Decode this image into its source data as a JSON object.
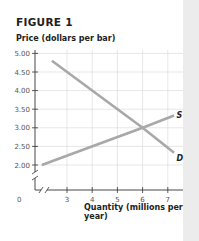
{
  "figure": {
    "title": "FIGURE 1"
  },
  "chart_data": {
    "type": "line",
    "title": "FIGURE 1",
    "ylabel": "Price (dollars per bar)",
    "xlabel": "Quantity (millions per year)",
    "y_ticks": [
      "5.00",
      "4.50",
      "4.00",
      "3.50",
      "3.00",
      "2.50",
      "2.00"
    ],
    "x_ticks": [
      "0",
      "3",
      "4",
      "5",
      "6",
      "7"
    ],
    "ylim": [
      2.0,
      5.0
    ],
    "xlim": [
      0,
      7.5
    ],
    "axis_break": true,
    "grid": true,
    "series": [
      {
        "name": "S",
        "label": "Supply",
        "color": "#a8a8a8",
        "x": [
          2.0,
          6.0,
          7.25
        ],
        "y": [
          2.0,
          3.0,
          3.33
        ]
      },
      {
        "name": "D",
        "label": "Demand",
        "color": "#a8a8a8",
        "x": [
          2.4,
          6.0,
          7.25
        ],
        "y": [
          4.8,
          3.0,
          2.33
        ]
      }
    ],
    "annotations": [
      {
        "text": "S",
        "x": 7.35,
        "y": 3.35
      },
      {
        "text": "D",
        "x": 7.35,
        "y": 2.2
      }
    ],
    "equilibrium": {
      "x": 6,
      "y": 3.0
    }
  }
}
